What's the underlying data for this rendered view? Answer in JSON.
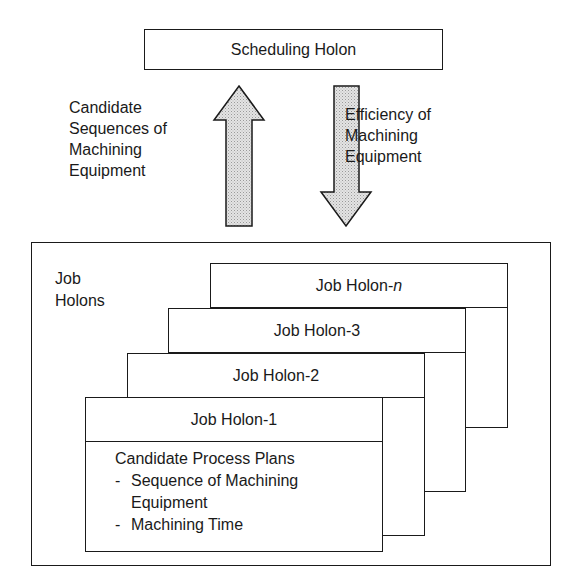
{
  "scheduling_holon": {
    "label": "Scheduling Holon"
  },
  "arrows": {
    "up": {
      "direction": "up",
      "label_lines": [
        "Candidate",
        "Sequences of",
        "Machining",
        "Equipment"
      ],
      "fill": "#d9d9d9"
    },
    "down": {
      "direction": "down",
      "label_lines": [
        "Efficiency of",
        "Machining",
        "Equipment"
      ],
      "fill": "#d9d9d9"
    }
  },
  "job_holons_container": {
    "label_lines": [
      "Job",
      "Holons"
    ],
    "cards": [
      {
        "title_prefix": "Job Holon-",
        "title_suffix_italic": "n"
      },
      {
        "title": "Job Holon-3"
      },
      {
        "title": "Job Holon-2"
      },
      {
        "title": "Job Holon-1",
        "body_heading": "Candidate Process Plans",
        "bullets": [
          {
            "dash": "-",
            "lines": [
              "Sequence of Machining",
              "Equipment"
            ]
          },
          {
            "dash": "-",
            "lines": [
              "Machining Time"
            ]
          }
        ]
      }
    ]
  }
}
